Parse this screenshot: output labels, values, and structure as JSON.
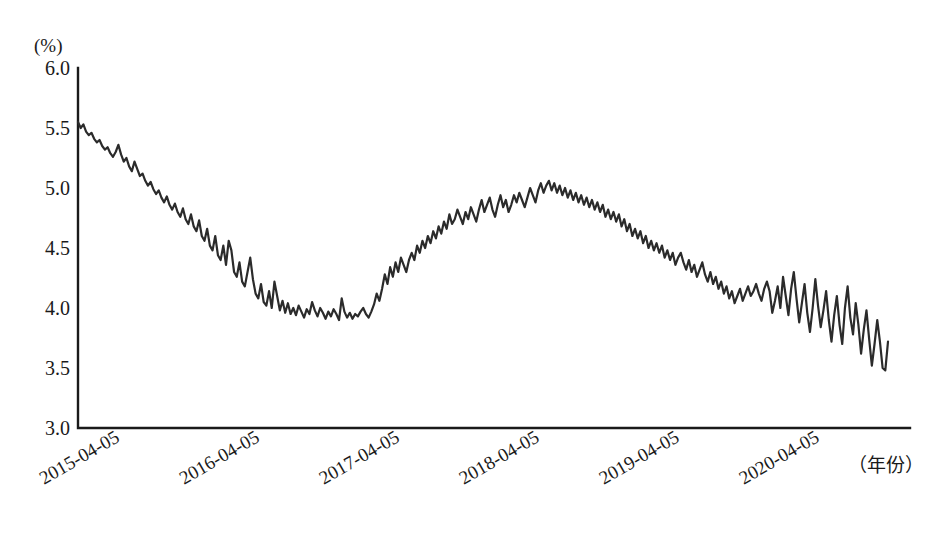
{
  "chart_data": {
    "type": "line",
    "title": "",
    "subtitle": "",
    "xlabel": "（年份）",
    "ylabel": "(%)",
    "ylim": [
      3.0,
      6.0
    ],
    "ytick_labels": [
      "6.0",
      "5.5",
      "5.0",
      "4.5",
      "4.0",
      "3.5",
      "3.0"
    ],
    "ytick_values": [
      6.0,
      5.5,
      5.0,
      4.5,
      4.0,
      3.5,
      3.0
    ],
    "xtick_labels": [
      "2015-04-05",
      "2016-04-05",
      "2017-04-05",
      "2018-04-05",
      "2019-04-05",
      "2020-04-05"
    ],
    "xtick_values": [
      0,
      52,
      104,
      156,
      208,
      260
    ],
    "xlim": [
      0,
      282
    ],
    "grid": false,
    "legend": [],
    "legend_position": "none",
    "line_color": "#2b2b2b",
    "series": [
      {
        "name": "yield",
        "values": [
          5.55,
          5.5,
          5.53,
          5.47,
          5.44,
          5.46,
          5.41,
          5.38,
          5.4,
          5.35,
          5.32,
          5.34,
          5.29,
          5.26,
          5.3,
          5.36,
          5.28,
          5.22,
          5.25,
          5.18,
          5.14,
          5.22,
          5.16,
          5.1,
          5.12,
          5.06,
          5.02,
          5.05,
          4.99,
          4.95,
          4.98,
          4.92,
          4.88,
          4.93,
          4.86,
          4.82,
          4.87,
          4.8,
          4.76,
          4.83,
          4.74,
          4.7,
          4.78,
          4.68,
          4.64,
          4.73,
          4.6,
          4.56,
          4.66,
          4.52,
          4.48,
          4.6,
          4.44,
          4.4,
          4.52,
          4.36,
          4.56,
          4.48,
          4.3,
          4.26,
          4.38,
          4.22,
          4.18,
          4.3,
          4.42,
          4.24,
          4.12,
          4.08,
          4.2,
          4.05,
          4.02,
          4.14,
          4.0,
          4.22,
          4.1,
          3.98,
          4.06,
          3.96,
          4.04,
          3.95,
          4.0,
          3.94,
          4.02,
          3.97,
          3.92,
          3.99,
          3.95,
          4.05,
          3.98,
          3.93,
          4.0,
          3.96,
          3.91,
          3.97,
          3.93,
          3.99,
          3.95,
          3.9,
          4.08,
          3.97,
          3.92,
          3.96,
          3.91,
          3.95,
          3.93,
          3.97,
          4.0,
          3.95,
          3.92,
          3.97,
          4.03,
          4.12,
          4.06,
          4.16,
          4.28,
          4.2,
          4.34,
          4.26,
          4.38,
          4.3,
          4.42,
          4.36,
          4.3,
          4.4,
          4.46,
          4.4,
          4.52,
          4.46,
          4.56,
          4.5,
          4.6,
          4.54,
          4.64,
          4.58,
          4.68,
          4.62,
          4.72,
          4.66,
          4.78,
          4.7,
          4.74,
          4.82,
          4.76,
          4.7,
          4.8,
          4.74,
          4.84,
          4.78,
          4.72,
          4.82,
          4.9,
          4.8,
          4.86,
          4.92,
          4.82,
          4.76,
          4.86,
          4.94,
          4.84,
          4.9,
          4.8,
          4.86,
          4.94,
          4.88,
          4.96,
          4.9,
          4.84,
          4.92,
          5.0,
          4.94,
          4.88,
          4.98,
          5.04,
          4.96,
          5.02,
          5.06,
          4.98,
          5.04,
          4.96,
          5.02,
          4.94,
          5.0,
          4.92,
          4.98,
          4.9,
          4.96,
          4.88,
          4.94,
          4.86,
          4.92,
          4.84,
          4.9,
          4.82,
          4.88,
          4.8,
          4.86,
          4.76,
          4.82,
          4.74,
          4.8,
          4.72,
          4.78,
          4.68,
          4.74,
          4.64,
          4.7,
          4.6,
          4.66,
          4.58,
          4.64,
          4.54,
          4.6,
          4.5,
          4.56,
          4.48,
          4.54,
          4.46,
          4.52,
          4.42,
          4.48,
          4.4,
          4.46,
          4.36,
          4.42,
          4.46,
          4.38,
          4.32,
          4.4,
          4.3,
          4.36,
          4.26,
          4.32,
          4.38,
          4.28,
          4.22,
          4.3,
          4.2,
          4.26,
          4.16,
          4.22,
          4.12,
          4.18,
          4.08,
          4.14,
          4.04,
          4.1,
          4.16,
          4.06,
          4.12,
          4.18,
          4.1,
          4.14,
          4.2,
          4.12,
          4.06,
          4.16,
          4.22,
          4.14,
          3.96,
          4.06,
          4.18,
          4.0,
          4.26,
          4.1,
          3.94,
          4.16,
          4.3,
          4.08,
          3.88,
          4.04,
          4.2,
          3.96,
          3.8,
          4.0,
          4.24,
          4.02,
          3.84,
          3.98,
          4.14,
          3.9,
          3.72,
          3.94,
          4.1,
          3.86,
          3.7,
          4.0,
          4.18,
          3.92,
          3.78,
          4.04,
          3.86,
          3.62,
          3.82,
          3.98,
          3.74,
          3.52,
          3.7,
          3.9,
          3.72,
          3.5,
          3.48,
          3.72
        ]
      }
    ]
  }
}
